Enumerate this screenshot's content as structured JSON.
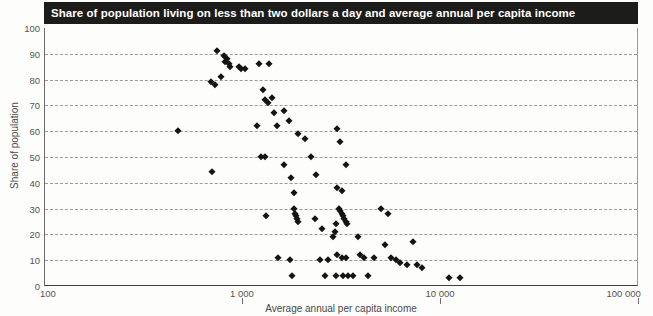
{
  "chart_data": {
    "type": "scatter",
    "title": "Share of population living on less than two dollars a day and average annual per capita income",
    "xlabel": "Average annual per capita income",
    "ylabel": "Share of population",
    "xscale": "log",
    "xlim": [
      100,
      100000
    ],
    "ylim": [
      0,
      100
    ],
    "xticks": [
      100,
      1000,
      10000,
      100000
    ],
    "xticklabels": [
      "100",
      "1 000",
      "10 000",
      "100 000"
    ],
    "yticks": [
      0,
      10,
      20,
      30,
      40,
      50,
      60,
      70,
      80,
      90,
      100
    ],
    "yticklabels": [
      "0",
      "10",
      "20",
      "30",
      "40",
      "50",
      "60",
      "70",
      "80",
      "90",
      "100"
    ],
    "grid": "horizontal-dashed",
    "legend": null,
    "marker": "diamond",
    "marker_color": "#141414",
    "points": [
      {
        "x": 470,
        "y": 60
      },
      {
        "x": 700,
        "y": 44
      },
      {
        "x": 740,
        "y": 91
      },
      {
        "x": 800,
        "y": 89
      },
      {
        "x": 815,
        "y": 87
      },
      {
        "x": 830,
        "y": 88
      },
      {
        "x": 845,
        "y": 86
      },
      {
        "x": 860,
        "y": 85
      },
      {
        "x": 690,
        "y": 79
      },
      {
        "x": 720,
        "y": 78
      },
      {
        "x": 775,
        "y": 81
      },
      {
        "x": 960,
        "y": 85
      },
      {
        "x": 980,
        "y": 84
      },
      {
        "x": 1020,
        "y": 84
      },
      {
        "x": 1180,
        "y": 62
      },
      {
        "x": 1200,
        "y": 86
      },
      {
        "x": 1350,
        "y": 86
      },
      {
        "x": 1260,
        "y": 76
      },
      {
        "x": 1290,
        "y": 72
      },
      {
        "x": 1330,
        "y": 71
      },
      {
        "x": 1400,
        "y": 73
      },
      {
        "x": 1240,
        "y": 50
      },
      {
        "x": 1290,
        "y": 50
      },
      {
        "x": 1440,
        "y": 67
      },
      {
        "x": 1490,
        "y": 62
      },
      {
        "x": 1300,
        "y": 27
      },
      {
        "x": 1620,
        "y": 68
      },
      {
        "x": 1700,
        "y": 64
      },
      {
        "x": 1900,
        "y": 59
      },
      {
        "x": 1620,
        "y": 47
      },
      {
        "x": 1750,
        "y": 42
      },
      {
        "x": 1800,
        "y": 36
      },
      {
        "x": 1820,
        "y": 30
      },
      {
        "x": 1840,
        "y": 28
      },
      {
        "x": 1860,
        "y": 27
      },
      {
        "x": 1880,
        "y": 26
      },
      {
        "x": 1900,
        "y": 25
      },
      {
        "x": 1500,
        "y": 11
      },
      {
        "x": 1720,
        "y": 10
      },
      {
        "x": 1760,
        "y": 4
      },
      {
        "x": 2050,
        "y": 57
      },
      {
        "x": 2200,
        "y": 50
      },
      {
        "x": 2350,
        "y": 43
      },
      {
        "x": 2300,
        "y": 26
      },
      {
        "x": 2500,
        "y": 22
      },
      {
        "x": 2450,
        "y": 10
      },
      {
        "x": 2700,
        "y": 10
      },
      {
        "x": 2600,
        "y": 4
      },
      {
        "x": 3000,
        "y": 61
      },
      {
        "x": 3100,
        "y": 56
      },
      {
        "x": 3300,
        "y": 47
      },
      {
        "x": 3000,
        "y": 38
      },
      {
        "x": 3150,
        "y": 37
      },
      {
        "x": 3050,
        "y": 30
      },
      {
        "x": 3100,
        "y": 29
      },
      {
        "x": 3150,
        "y": 28
      },
      {
        "x": 3200,
        "y": 27
      },
      {
        "x": 3250,
        "y": 26
      },
      {
        "x": 3300,
        "y": 25
      },
      {
        "x": 3350,
        "y": 24
      },
      {
        "x": 2950,
        "y": 24
      },
      {
        "x": 2900,
        "y": 21
      },
      {
        "x": 2850,
        "y": 19
      },
      {
        "x": 3000,
        "y": 12
      },
      {
        "x": 3150,
        "y": 11
      },
      {
        "x": 3300,
        "y": 11
      },
      {
        "x": 2950,
        "y": 4
      },
      {
        "x": 3200,
        "y": 4
      },
      {
        "x": 3400,
        "y": 4
      },
      {
        "x": 3600,
        "y": 4
      },
      {
        "x": 3800,
        "y": 19
      },
      {
        "x": 3900,
        "y": 12
      },
      {
        "x": 4100,
        "y": 11
      },
      {
        "x": 4300,
        "y": 4
      },
      {
        "x": 4600,
        "y": 11
      },
      {
        "x": 5000,
        "y": 30
      },
      {
        "x": 5400,
        "y": 28
      },
      {
        "x": 5200,
        "y": 16
      },
      {
        "x": 5600,
        "y": 11
      },
      {
        "x": 5900,
        "y": 10
      },
      {
        "x": 6200,
        "y": 9
      },
      {
        "x": 6700,
        "y": 8
      },
      {
        "x": 7200,
        "y": 17
      },
      {
        "x": 7600,
        "y": 8
      },
      {
        "x": 8000,
        "y": 7
      },
      {
        "x": 11000,
        "y": 3
      },
      {
        "x": 12500,
        "y": 3
      }
    ]
  }
}
